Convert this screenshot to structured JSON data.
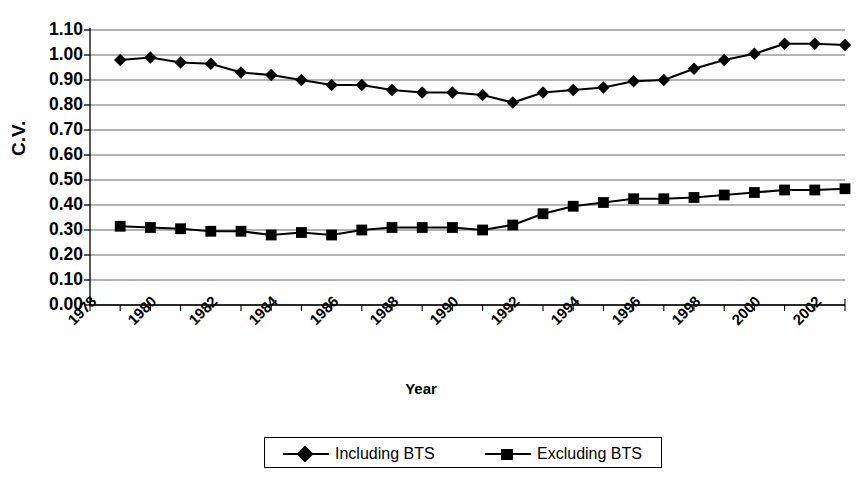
{
  "chart_data": {
    "type": "line",
    "title": "",
    "xlabel": "Year",
    "ylabel": "C.V.",
    "grid": true,
    "legend_position": "bottom",
    "xlim": [
      1978,
      2003
    ],
    "ylim": [
      0.0,
      1.1
    ],
    "y_ticks": [
      "1.10",
      "1.00",
      "0.90",
      "0.80",
      "0.70",
      "0.60",
      "0.50",
      "0.40",
      "0.30",
      "0.20",
      "0.10",
      "0.00"
    ],
    "x_ticks": [
      "1978",
      "1980",
      "1982",
      "1984",
      "1986",
      "1988",
      "1990",
      "1992",
      "1994",
      "1996",
      "1998",
      "2000",
      "2002"
    ],
    "x": [
      1979,
      1980,
      1981,
      1982,
      1983,
      1984,
      1985,
      1986,
      1987,
      1988,
      1989,
      1990,
      1991,
      1992,
      1993,
      1994,
      1995,
      1996,
      1997,
      1998,
      1999,
      2000,
      2001,
      2002,
      2003
    ],
    "series": [
      {
        "name": "Including BTS",
        "marker": "diamond",
        "color": "#000000",
        "values": [
          0.98,
          0.99,
          0.97,
          0.965,
          0.93,
          0.92,
          0.9,
          0.88,
          0.88,
          0.86,
          0.85,
          0.85,
          0.84,
          0.81,
          0.85,
          0.86,
          0.87,
          0.895,
          0.9,
          0.945,
          0.98,
          1.005,
          1.045,
          1.045,
          1.04
        ]
      },
      {
        "name": "Excluding BTS",
        "marker": "square",
        "color": "#000000",
        "values": [
          0.315,
          0.31,
          0.305,
          0.295,
          0.295,
          0.28,
          0.29,
          0.28,
          0.3,
          0.31,
          0.31,
          0.31,
          0.3,
          0.32,
          0.365,
          0.395,
          0.41,
          0.425,
          0.425,
          0.43,
          0.44,
          0.45,
          0.46,
          0.46,
          0.465
        ]
      }
    ]
  },
  "legend": {
    "items": [
      {
        "label": "Including BTS",
        "marker": "diamond"
      },
      {
        "label": "Excluding BTS",
        "marker": "square"
      }
    ]
  }
}
